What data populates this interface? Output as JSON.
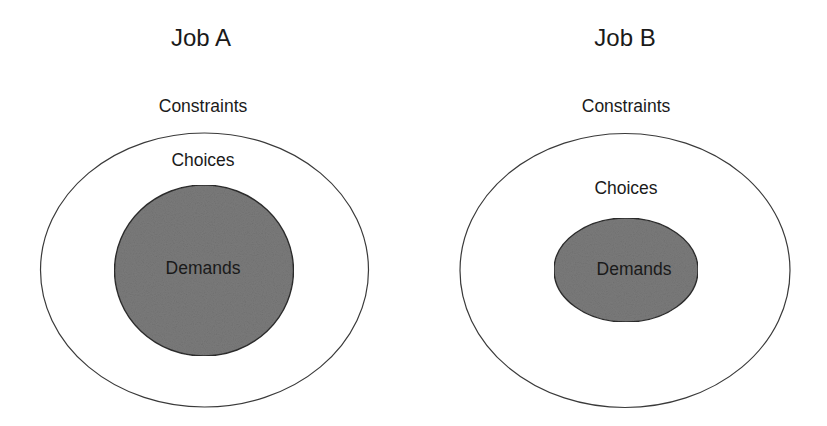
{
  "diagram": {
    "type": "nested-ellipses",
    "panels": [
      {
        "title": "Job A",
        "outer_label": "Constraints",
        "middle_label": "Choices",
        "inner_label": "Demands",
        "outer_ellipse": {
          "cx": 204.5,
          "cy": 270,
          "rx": 164,
          "ry": 137
        },
        "inner_ellipse": {
          "cx": 204,
          "cy": 270.5,
          "rx": 89.5,
          "ry": 85.5
        }
      },
      {
        "title": "Job B",
        "outer_label": "Constraints",
        "middle_label": "Choices",
        "inner_label": "Demands",
        "outer_ellipse": {
          "cx": 625,
          "cy": 270.5,
          "rx": 165,
          "ry": 137
        },
        "inner_ellipse": {
          "cx": 626,
          "cy": 270,
          "rx": 72,
          "ry": 52
        }
      }
    ],
    "colors": {
      "outline": "#333333",
      "inner_fill": "#7b7b7b",
      "background": "#ffffff",
      "text": "#1a1a1a"
    }
  }
}
